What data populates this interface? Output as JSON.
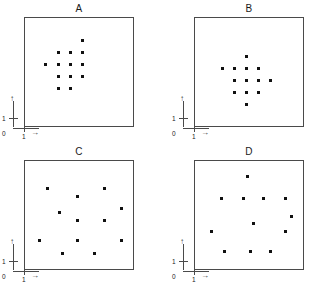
{
  "figure": {
    "width": 315,
    "height": 292,
    "background_color": "#ffffff",
    "frame_color": "#4a4a4a",
    "dot_color": "#111111",
    "axis_color": "#2b2b2b"
  },
  "axis_annotation": {
    "origin_label": "0",
    "y_tick_label": "1",
    "x_tick_label": "1",
    "y_arrow": "↑",
    "x_arrow": "→"
  },
  "panels": [
    {
      "id": "A",
      "title": "A",
      "frame": {
        "x": 24,
        "y": 17,
        "w": 110,
        "h": 110
      },
      "dot_count": 13
    },
    {
      "id": "B",
      "title": "B",
      "frame": {
        "x": 194,
        "y": 17,
        "w": 110,
        "h": 110
      },
      "dot_count": 13
    },
    {
      "id": "C",
      "title": "C",
      "frame": {
        "x": 24,
        "y": 160,
        "w": 110,
        "h": 110
      },
      "dot_count": 13
    },
    {
      "id": "D",
      "title": "D",
      "frame": {
        "x": 194,
        "y": 160,
        "w": 110,
        "h": 110
      },
      "dot_count": 13
    }
  ],
  "chart_data": {
    "type": "scatter",
    "title": "",
    "xlabel": "",
    "ylabel": "",
    "grid": false,
    "legend": "none",
    "panel_layout": "2x2",
    "note": "Four scatter panels labelled A, B, C, D. Panels A and B show tightly clustered diamond-shaped dot groups; panels C and D show widely dispersed dots spanning the full frame. Coordinates below are fractions of the plot frame, x rightwards and y upwards from the frame origin.",
    "panels": [
      {
        "name": "A",
        "n": 13,
        "xlim": [
          0,
          1
        ],
        "ylim": [
          0,
          1
        ],
        "points": [
          [
            0.52,
            0.8
          ],
          [
            0.3,
            0.69
          ],
          [
            0.41,
            0.69
          ],
          [
            0.52,
            0.69
          ],
          [
            0.19,
            0.58
          ],
          [
            0.3,
            0.58
          ],
          [
            0.41,
            0.58
          ],
          [
            0.52,
            0.58
          ],
          [
            0.3,
            0.47
          ],
          [
            0.41,
            0.47
          ],
          [
            0.52,
            0.47
          ],
          [
            0.3,
            0.36
          ],
          [
            0.41,
            0.36
          ]
        ]
      },
      {
        "name": "B",
        "n": 13,
        "xlim": [
          0,
          1
        ],
        "ylim": [
          0,
          1
        ],
        "points": [
          [
            0.47,
            0.65
          ],
          [
            0.25,
            0.54
          ],
          [
            0.36,
            0.54
          ],
          [
            0.47,
            0.54
          ],
          [
            0.58,
            0.54
          ],
          [
            0.36,
            0.43
          ],
          [
            0.47,
            0.43
          ],
          [
            0.58,
            0.43
          ],
          [
            0.69,
            0.43
          ],
          [
            0.36,
            0.32
          ],
          [
            0.47,
            0.32
          ],
          [
            0.58,
            0.32
          ],
          [
            0.47,
            0.21
          ]
        ]
      },
      {
        "name": "C",
        "n": 13,
        "xlim": [
          0,
          1
        ],
        "ylim": [
          0,
          1
        ],
        "points": [
          [
            0.2,
            0.75
          ],
          [
            0.48,
            0.68
          ],
          [
            0.72,
            0.75
          ],
          [
            0.88,
            0.57
          ],
          [
            0.31,
            0.53
          ],
          [
            0.48,
            0.46
          ],
          [
            0.72,
            0.46
          ],
          [
            0.13,
            0.28
          ],
          [
            0.48,
            0.28
          ],
          [
            0.88,
            0.28
          ],
          [
            0.34,
            0.16
          ],
          [
            0.63,
            0.16
          ],
          [
            0.48,
            0.28
          ]
        ]
      },
      {
        "name": "D",
        "n": 13,
        "xlim": [
          0,
          1
        ],
        "ylim": [
          0,
          1
        ],
        "points": [
          [
            0.48,
            0.86
          ],
          [
            0.24,
            0.66
          ],
          [
            0.44,
            0.66
          ],
          [
            0.62,
            0.66
          ],
          [
            0.82,
            0.66
          ],
          [
            0.88,
            0.5
          ],
          [
            0.53,
            0.43
          ],
          [
            0.15,
            0.36
          ],
          [
            0.82,
            0.36
          ],
          [
            0.27,
            0.18
          ],
          [
            0.5,
            0.18
          ],
          [
            0.69,
            0.18
          ],
          [
            0.82,
            0.36
          ]
        ]
      }
    ]
  }
}
